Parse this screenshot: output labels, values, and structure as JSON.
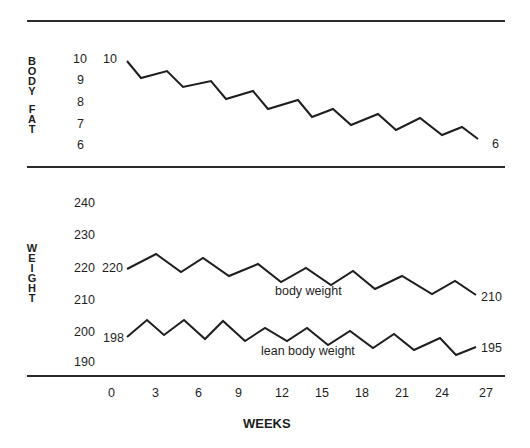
{
  "chart_data": [
    {
      "type": "line",
      "title": "",
      "ylabel": "BODY FAT",
      "xlabel": "WEEKS",
      "yticks": [
        "10",
        "9",
        "8",
        "7",
        "6"
      ],
      "ylim": [
        6,
        10
      ],
      "series": [
        {
          "name": "body fat",
          "start_label": "10",
          "end_label": "6",
          "x": [
            0,
            1.5,
            4,
            5.5,
            8,
            9.5,
            12,
            13.5,
            16,
            17.5,
            20,
            21.5,
            24,
            26,
            27.5,
            29.5,
            31.5,
            33
          ],
          "values": [
            10,
            9.2,
            9.4,
            8.8,
            8.9,
            8.2,
            8.4,
            7.7,
            7.9,
            7.3,
            7.5,
            6.9,
            7.2,
            6.6,
            6.9,
            6.4,
            6.5,
            6.0
          ]
        }
      ],
      "pixel_points": [
        [
          127,
          61
        ],
        [
          141,
          78
        ],
        [
          167,
          71
        ],
        [
          183,
          87
        ],
        [
          211,
          81
        ],
        [
          226,
          99
        ],
        [
          253,
          91
        ],
        [
          268,
          109
        ],
        [
          298,
          100
        ],
        [
          312,
          117
        ],
        [
          333,
          109
        ],
        [
          351,
          125
        ],
        [
          378,
          114
        ],
        [
          396,
          130
        ],
        [
          420,
          118
        ],
        [
          442,
          135
        ],
        [
          462,
          127
        ],
        [
          478,
          139
        ]
      ]
    },
    {
      "type": "line",
      "title": "",
      "ylabel": "WEIGHT",
      "xlabel": "WEEKS",
      "yticks": [
        "240",
        "230",
        "220",
        "210",
        "200",
        "190"
      ],
      "ylim": [
        190,
        240
      ],
      "xticks": [
        "0",
        "3",
        "6",
        "9",
        "12",
        "15",
        "18",
        "21",
        "24",
        "27"
      ],
      "xlim": [
        0,
        27
      ],
      "grid": false,
      "series": [
        {
          "name": "body weight",
          "start_label": "220",
          "end_label": "210",
          "x": [
            0,
            2.5,
            4.5,
            6.5,
            9,
            11.5,
            13.5,
            15.5,
            18,
            20,
            22,
            24.5,
            26
          ],
          "values": [
            220,
            224,
            219,
            223,
            218,
            221,
            216,
            220,
            215,
            218,
            213,
            216,
            211
          ],
          "pixel_points": [
            [
              127,
              269
            ],
            [
              156,
              254
            ],
            [
              181,
              272
            ],
            [
              203,
              258
            ],
            [
              229,
              276
            ],
            [
              258,
              264
            ],
            [
              281,
              282
            ],
            [
              306,
              268
            ],
            [
              331,
              285
            ],
            [
              353,
              271
            ],
            [
              375,
              289
            ],
            [
              402,
              276
            ],
            [
              432,
              294
            ],
            [
              455,
              281
            ],
            [
              476,
              295
            ]
          ]
        },
        {
          "name": "lean body weight",
          "start_label": "198",
          "end_label": "195",
          "values": [
            198,
            203,
            199,
            203,
            198,
            203,
            197,
            201,
            197,
            201,
            196,
            199,
            195,
            198,
            194,
            197,
            193,
            195
          ],
          "pixel_points": [
            [
              127,
              337
            ],
            [
              147,
              320
            ],
            [
              164,
              335
            ],
            [
              184,
              320
            ],
            [
              205,
              339
            ],
            [
              223,
              321
            ],
            [
              245,
              341
            ],
            [
              265,
              328
            ],
            [
              287,
              341
            ],
            [
              307,
              328
            ],
            [
              328,
              345
            ],
            [
              350,
              331
            ],
            [
              373,
              348
            ],
            [
              394,
              334
            ],
            [
              414,
              350
            ],
            [
              440,
              338
            ],
            [
              456,
              355
            ],
            [
              476,
              347
            ]
          ]
        }
      ]
    }
  ],
  "labels": {
    "body_fat_axis": [
      "B",
      "O",
      "D",
      "Y",
      "",
      "F",
      "A",
      "T"
    ],
    "weight_axis": [
      "W",
      "E",
      "I",
      "G",
      "H",
      "T"
    ],
    "body_fat_ticks": [
      "10",
      "9",
      "8",
      "7",
      "6"
    ],
    "weight_ticks": [
      "240",
      "230",
      "220",
      "210",
      "200",
      "190"
    ],
    "week_ticks": [
      "0",
      "3",
      "6",
      "9",
      "12",
      "15",
      "18",
      "21",
      "24",
      "27"
    ],
    "x_axis_title": "WEEKS",
    "body_fat_start": "10",
    "body_fat_end": "6",
    "body_weight_start": "220",
    "body_weight_end": "210",
    "body_weight_name": "body weight",
    "lean_start": "198",
    "lean_end": "195",
    "lean_name": "lean body weight"
  }
}
